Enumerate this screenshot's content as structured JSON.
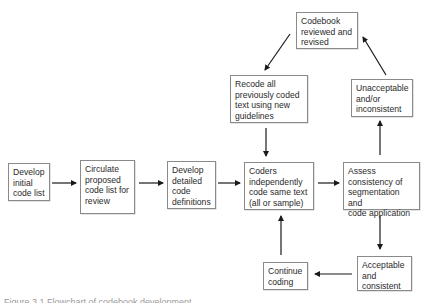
{
  "diagram": {
    "type": "flowchart",
    "nodes": [
      {
        "id": "develop-initial",
        "label": "Develop\ninitial\ncode list"
      },
      {
        "id": "circulate",
        "label": "Circulate\nproposed\ncode list for\nreview"
      },
      {
        "id": "develop-detailed",
        "label": "Develop\ndetailed\ncode\ndefinitions"
      },
      {
        "id": "coders",
        "label": "Coders\nindependently\ncode same text\n(all or sample)"
      },
      {
        "id": "assess",
        "label": "Assess\nconsistency of\nsegmentation and\ncode application"
      },
      {
        "id": "unacceptable",
        "label": "Unacceptable\nand/or\ninconsistent"
      },
      {
        "id": "codebook",
        "label": "Codebook\nreviewed and\nrevised"
      },
      {
        "id": "recode",
        "label": "Recode all\npreviously coded\ntext using new\nguidelines"
      },
      {
        "id": "acceptable",
        "label": "Acceptable\nand\nconsistent"
      },
      {
        "id": "continue",
        "label": "Continue\ncoding"
      }
    ],
    "edges": [
      {
        "from": "develop-initial",
        "to": "circulate"
      },
      {
        "from": "circulate",
        "to": "develop-detailed"
      },
      {
        "from": "develop-detailed",
        "to": "coders"
      },
      {
        "from": "coders",
        "to": "assess"
      },
      {
        "from": "assess",
        "to": "unacceptable"
      },
      {
        "from": "unacceptable",
        "to": "codebook"
      },
      {
        "from": "codebook",
        "to": "recode"
      },
      {
        "from": "recode",
        "to": "coders"
      },
      {
        "from": "assess",
        "to": "acceptable"
      },
      {
        "from": "acceptable",
        "to": "continue"
      },
      {
        "from": "continue",
        "to": "coders"
      }
    ],
    "colors": {
      "box_border": "#8a8a8a",
      "arrow": "#1a1a1a",
      "text": "#2a2a2a"
    },
    "caption": "Figure 3.1  Flowchart of codebook development"
  }
}
